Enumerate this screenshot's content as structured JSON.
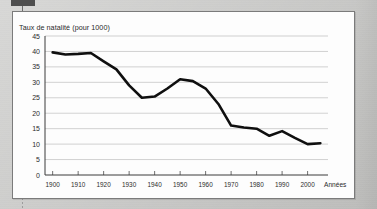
{
  "window": {
    "background_color": "#c7c7c5",
    "top_bar_color": "#4e4e4e",
    "frame_background_color": "#fdfdfd",
    "frame_border_color": "#7b7b7b"
  },
  "chart_data": {
    "type": "line",
    "title": "Taux de natalité (pour 1000)",
    "xlabel": "Années",
    "ylabel": "",
    "xlim": [
      1897,
      2008
    ],
    "ylim": [
      0,
      45
    ],
    "grid": true,
    "legend": "none",
    "y_ticks": [
      0,
      5,
      10,
      15,
      20,
      25,
      30,
      35,
      40,
      45
    ],
    "y_tick_labels": [
      "0",
      "5",
      "10",
      "15",
      "20",
      "25",
      "30",
      "35",
      "40",
      "45"
    ],
    "x_ticks": [
      1900,
      1910,
      1920,
      1930,
      1940,
      1950,
      1960,
      1970,
      1980,
      1990,
      2000
    ],
    "x_tick_labels": [
      "1900",
      "1910",
      "1920",
      "1930",
      "1940",
      "1950",
      "1960",
      "1970",
      "1980",
      "1990",
      "2000"
    ],
    "line_color": "#0f0f0f",
    "series": [
      {
        "name": "Taux de natalité",
        "x": [
          1900,
          1905,
          1910,
          1915,
          1920,
          1925,
          1930,
          1935,
          1940,
          1945,
          1950,
          1955,
          1960,
          1965,
          1970,
          1975,
          1980,
          1985,
          1990,
          1995,
          2000,
          2005
        ],
        "values": [
          39.7,
          39.0,
          39.2,
          39.5,
          36.8,
          34.2,
          29.0,
          25.0,
          25.4,
          28.0,
          31.0,
          30.4,
          28.0,
          23.0,
          16.0,
          15.4,
          15.0,
          12.7,
          14.2,
          12.0,
          10.0,
          10.3
        ]
      }
    ]
  }
}
